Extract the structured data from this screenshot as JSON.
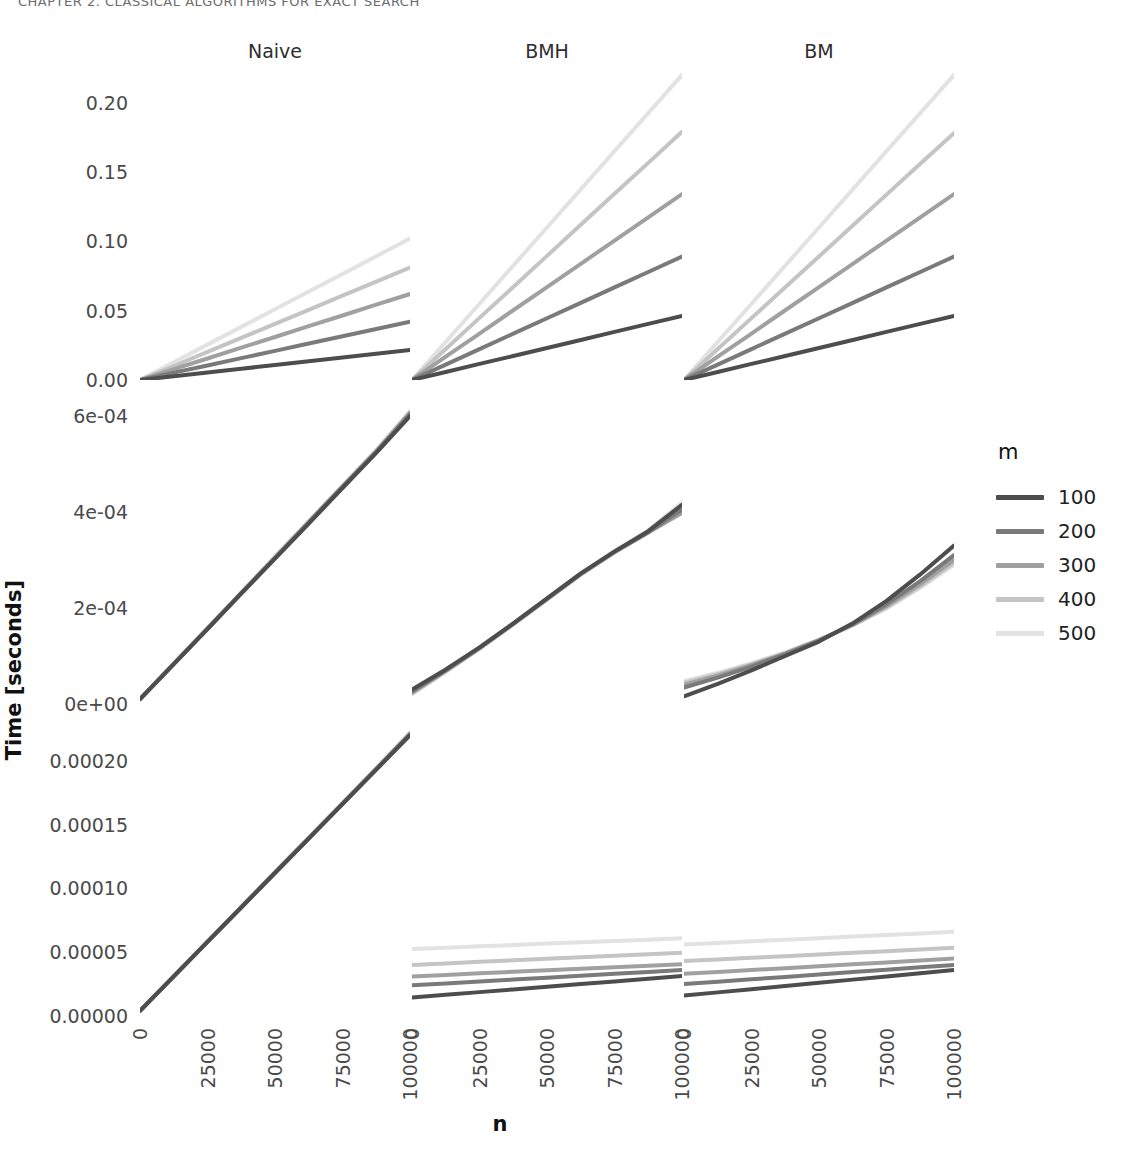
{
  "running_header": "CHAPTER 2.   CLASSICAL ALGORITHMS FOR EXACT SEARCH",
  "axis": {
    "x_title": "n",
    "y_title": "Time [seconds]",
    "x_ticks": [
      "0",
      "25000",
      "50000",
      "75000",
      "100000"
    ],
    "x_values": [
      0,
      25000,
      50000,
      75000,
      100000
    ]
  },
  "legend": {
    "title": "m",
    "entries": [
      {
        "label": "100",
        "color": "#4d4d4d"
      },
      {
        "label": "200",
        "color": "#7a7a7a"
      },
      {
        "label": "300",
        "color": "#a0a0a0"
      },
      {
        "label": "400",
        "color": "#c4c4c4"
      },
      {
        "label": "500",
        "color": "#e2e2e2"
      }
    ]
  },
  "columns": [
    {
      "label": "Naive"
    },
    {
      "label": "BMH"
    },
    {
      "label": "BM"
    }
  ],
  "rows": [
    {
      "label": "EQUAL"
    },
    {
      "label": "DNA"
    },
    {
      "label": "8-bit"
    }
  ],
  "chart_data": {
    "type": "line",
    "title": "",
    "xlabel": "n",
    "ylabel": "Time [seconds]",
    "facet_cols": [
      "Naive",
      "BMH",
      "BM"
    ],
    "facet_rows": [
      "EQUAL",
      "DNA",
      "8-bit"
    ],
    "legend_title": "m",
    "legend_position": "right",
    "grid": false,
    "x": [
      0,
      12500,
      25000,
      37500,
      50000,
      62500,
      75000,
      87500,
      100000
    ],
    "series_names": [
      "100",
      "200",
      "300",
      "400",
      "500"
    ],
    "series_colors": [
      "#4d4d4d",
      "#7a7a7a",
      "#a0a0a0",
      "#c4c4c4",
      "#e2e2e2"
    ],
    "panels": [
      {
        "row": "EQUAL",
        "col": "Naive",
        "ylim": [
          0.0,
          0.225
        ],
        "y_ticks": [
          0.0,
          0.05,
          0.1,
          0.15,
          0.2
        ],
        "y_tick_labels": [
          "0.00",
          "0.05",
          "0.10",
          "0.15",
          "0.20"
        ],
        "series": [
          {
            "name": "100",
            "values": [
              0.0,
              0.0027,
              0.0054,
              0.0081,
              0.0108,
              0.0135,
              0.0162,
              0.0189,
              0.0216
            ]
          },
          {
            "name": "200",
            "values": [
              0.0,
              0.0053,
              0.0105,
              0.0158,
              0.021,
              0.0263,
              0.0315,
              0.0368,
              0.042
            ]
          },
          {
            "name": "300",
            "values": [
              0.0,
              0.0078,
              0.0155,
              0.0233,
              0.031,
              0.0388,
              0.0465,
              0.0543,
              0.062
            ]
          },
          {
            "name": "400",
            "values": [
              0.0,
              0.0101,
              0.0203,
              0.0304,
              0.0405,
              0.0506,
              0.0608,
              0.0709,
              0.081
            ]
          },
          {
            "name": "500",
            "values": [
              0.0,
              0.0128,
              0.0255,
              0.0383,
              0.051,
              0.0638,
              0.0765,
              0.0893,
              0.102
            ]
          }
        ]
      },
      {
        "row": "EQUAL",
        "col": "BMH",
        "ylim": [
          0.0,
          0.225
        ],
        "series": [
          {
            "name": "100",
            "values": [
              0.0,
              0.0058,
              0.0116,
              0.0173,
              0.0231,
              0.0289,
              0.0347,
              0.0405,
              0.0462
            ]
          },
          {
            "name": "200",
            "values": [
              0.0,
              0.0111,
              0.0223,
              0.0334,
              0.0445,
              0.0556,
              0.0668,
              0.0779,
              0.089
            ]
          },
          {
            "name": "300",
            "values": [
              0.0,
              0.0168,
              0.0335,
              0.0503,
              0.067,
              0.0838,
              0.1005,
              0.1173,
              0.134
            ]
          },
          {
            "name": "400",
            "values": [
              0.0,
              0.0224,
              0.0448,
              0.0671,
              0.0895,
              0.1119,
              0.1343,
              0.1566,
              0.179
            ]
          },
          {
            "name": "500",
            "values": [
              0.0,
              0.0275,
              0.055,
              0.0825,
              0.11,
              0.1375,
              0.165,
              0.1925,
              0.22
            ]
          }
        ]
      },
      {
        "row": "EQUAL",
        "col": "BM",
        "ylim": [
          0.0,
          0.225
        ],
        "series": [
          {
            "name": "100",
            "values": [
              0.0,
              0.0058,
              0.0116,
              0.0173,
              0.0231,
              0.0289,
              0.0347,
              0.0405,
              0.0462
            ]
          },
          {
            "name": "200",
            "values": [
              0.0,
              0.0111,
              0.0223,
              0.0334,
              0.0445,
              0.0556,
              0.0668,
              0.0779,
              0.089
            ]
          },
          {
            "name": "300",
            "values": [
              0.0,
              0.0168,
              0.0335,
              0.0503,
              0.067,
              0.0838,
              0.1005,
              0.1173,
              0.134
            ]
          },
          {
            "name": "400",
            "values": [
              0.0,
              0.0223,
              0.0446,
              0.0669,
              0.0891,
              0.1114,
              0.1337,
              0.156,
              0.178
            ]
          },
          {
            "name": "500",
            "values": [
              0.0,
              0.0275,
              0.055,
              0.0825,
              0.11,
              0.1375,
              0.165,
              0.1925,
              0.22
            ]
          }
        ]
      },
      {
        "row": "DNA",
        "col": "Naive",
        "ylim": [
          0.0,
          0.00065
        ],
        "y_ticks": [
          0.0,
          0.0002,
          0.0004,
          0.0006
        ],
        "y_tick_labels": [
          "0e+00",
          "2e-04",
          "4e-04",
          "6e-04"
        ],
        "series": [
          {
            "name": "100",
            "values": [
              1e-05,
              8.3e-05,
              0.000156,
              0.00023,
              0.000303,
              0.000376,
              0.00045,
              0.000523,
              0.0006
            ]
          },
          {
            "name": "200",
            "values": [
              1e-05,
              8.3e-05,
              0.000157,
              0.000231,
              0.000304,
              0.000378,
              0.000452,
              0.000525,
              0.000604
            ]
          },
          {
            "name": "300",
            "values": [
              1e-05,
              8.4e-05,
              0.000157,
              0.000231,
              0.000305,
              0.000379,
              0.000453,
              0.000526,
              0.000606
            ]
          },
          {
            "name": "400",
            "values": [
              1e-05,
              8.4e-05,
              0.000158,
              0.000232,
              0.000306,
              0.00038,
              0.000454,
              0.000528,
              0.000608
            ]
          },
          {
            "name": "500",
            "values": [
              1e-05,
              8.4e-05,
              0.000158,
              0.000232,
              0.000307,
              0.000381,
              0.000455,
              0.000529,
              0.00061
            ]
          }
        ]
      },
      {
        "row": "DNA",
        "col": "BMH",
        "ylim": [
          0.0,
          0.00065
        ],
        "series": [
          {
            "name": "100",
            "values": [
              3e-05,
              7.2e-05,
              0.000118,
              0.000168,
              0.00022,
              0.000272,
              0.000318,
              0.00036,
              0.000415
            ]
          },
          {
            "name": "200",
            "values": [
              2.6e-05,
              7e-05,
              0.000117,
              0.000167,
              0.000219,
              0.000271,
              0.000317,
              0.000358,
              0.000405
            ]
          },
          {
            "name": "300",
            "values": [
              2.4e-05,
              6.9e-05,
              0.000116,
              0.000167,
              0.000219,
              0.00027,
              0.000316,
              0.000357,
              0.000398
            ]
          },
          {
            "name": "400",
            "values": [
              2.2e-05,
              6.8e-05,
              0.000116,
              0.000166,
              0.000218,
              0.00027,
              0.000316,
              0.000358,
              0.000408
            ]
          },
          {
            "name": "500",
            "values": [
              2e-05,
              6.7e-05,
              0.000115,
              0.000166,
              0.000218,
              0.00027,
              0.000317,
              0.000362,
              0.00042
            ]
          }
        ]
      },
      {
        "row": "DNA",
        "col": "BM",
        "ylim": [
          0.0,
          0.00065
        ],
        "series": [
          {
            "name": "100",
            "values": [
              1.6e-05,
              4.2e-05,
              7e-05,
              0.0001,
              0.00013,
              0.000168,
              0.000215,
              0.00027,
              0.00033
            ]
          },
          {
            "name": "200",
            "values": [
              3.4e-05,
              5.5e-05,
              7.8e-05,
              0.000104,
              0.000132,
              0.000166,
              0.000208,
              0.000256,
              0.00031
            ]
          },
          {
            "name": "300",
            "values": [
              4e-05,
              5.9e-05,
              8.1e-05,
              0.000105,
              0.000133,
              0.000165,
              0.000204,
              0.00025,
              0.0003
            ]
          },
          {
            "name": "400",
            "values": [
              4.4e-05,
              6.2e-05,
              8.3e-05,
              0.000106,
              0.000133,
              0.000164,
              0.000201,
              0.000245,
              0.000294
            ]
          },
          {
            "name": "500",
            "values": [
              4.8e-05,
              6.5e-05,
              8.5e-05,
              0.000108,
              0.000134,
              0.000164,
              0.000199,
              0.000242,
              0.00029
            ]
          }
        ]
      },
      {
        "row": "8-bit",
        "col": "Naive",
        "ylim": [
          0.0,
          0.000235
        ],
        "y_ticks": [
          0.0,
          5e-05,
          0.0001,
          0.00015,
          0.0002
        ],
        "y_tick_labels": [
          "0.00000",
          "0.00005",
          "0.00010",
          "0.00015",
          "0.00020"
        ],
        "series": [
          {
            "name": "100",
            "values": [
              4e-06,
              3.1e-05,
              5.8e-05,
              8.5e-05,
              0.000112,
              0.000139,
              0.000166,
              0.000193,
              0.00022
            ]
          },
          {
            "name": "200",
            "values": [
              4e-06,
              3.1e-05,
              5.81e-05,
              8.51e-05,
              0.0001122,
              0.0001392,
              0.0001662,
              0.0001933,
              0.0002205
            ]
          },
          {
            "name": "300",
            "values": [
              4e-06,
              3.11e-05,
              5.82e-05,
              8.53e-05,
              0.0001124,
              0.0001394,
              0.0001665,
              0.0001936,
              0.000221
            ]
          },
          {
            "name": "400",
            "values": [
              4.1e-06,
              3.11e-05,
              5.83e-05,
              8.54e-05,
              0.0001125,
              0.0001396,
              0.0001667,
              0.0001939,
              0.0002215
            ]
          },
          {
            "name": "500",
            "values": [
              4.1e-06,
              3.12e-05,
              5.84e-05,
              8.55e-05,
              0.0001127,
              0.0001398,
              0.000167,
              0.0001942,
              0.000222
            ]
          }
        ]
      },
      {
        "row": "8-bit",
        "col": "BMH",
        "ylim": [
          0.0,
          0.000235
        ],
        "series": [
          {
            "name": "100",
            "values": [
              1.45e-05,
              1.66e-05,
              1.87e-05,
              2.08e-05,
              2.29e-05,
              2.5e-05,
              2.71e-05,
              2.92e-05,
              3.13e-05
            ]
          },
          {
            "name": "200",
            "values": [
              2.4e-05,
              2.55e-05,
              2.7e-05,
              2.85e-05,
              3e-05,
              3.15e-05,
              3.3e-05,
              3.45e-05,
              3.6e-05
            ]
          },
          {
            "name": "300",
            "values": [
              3.1e-05,
              3.22e-05,
              3.34e-05,
              3.46e-05,
              3.58e-05,
              3.7e-05,
              3.82e-05,
              3.94e-05,
              4.06e-05
            ]
          },
          {
            "name": "400",
            "values": [
              4e-05,
              4.12e-05,
              4.24e-05,
              4.36e-05,
              4.48e-05,
              4.6e-05,
              4.72e-05,
              4.84e-05,
              4.96e-05
            ]
          },
          {
            "name": "500",
            "values": [
              5.25e-05,
              5.35e-05,
              5.46e-05,
              5.56e-05,
              5.67e-05,
              5.77e-05,
              5.88e-05,
              5.98e-05,
              6.1e-05
            ]
          }
        ]
      },
      {
        "row": "8-bit",
        "col": "BM",
        "ylim": [
          0.0,
          0.000235
        ],
        "series": [
          {
            "name": "100",
            "values": [
              1.6e-05,
              1.85e-05,
              2.1e-05,
              2.35e-05,
              2.6e-05,
              2.85e-05,
              3.1e-05,
              3.35e-05,
              3.6e-05
            ]
          },
          {
            "name": "200",
            "values": [
              2.5e-05,
              2.69e-05,
              2.88e-05,
              3.06e-05,
              3.25e-05,
              3.44e-05,
              3.63e-05,
              3.81e-05,
              4e-05
            ]
          },
          {
            "name": "300",
            "values": [
              3.3e-05,
              3.45e-05,
              3.6e-05,
              3.75e-05,
              3.9e-05,
              4.05e-05,
              4.2e-05,
              4.35e-05,
              4.5e-05
            ]
          },
          {
            "name": "400",
            "values": [
              4.3e-05,
              4.43e-05,
              4.56e-05,
              4.69e-05,
              4.82e-05,
              4.95e-05,
              5.08e-05,
              5.21e-05,
              5.34e-05
            ]
          },
          {
            "name": "500",
            "values": [
              5.6e-05,
              5.72e-05,
              5.85e-05,
              5.97e-05,
              6.1e-05,
              6.22e-05,
              6.35e-05,
              6.47e-05,
              6.6e-05
            ]
          }
        ]
      }
    ]
  }
}
